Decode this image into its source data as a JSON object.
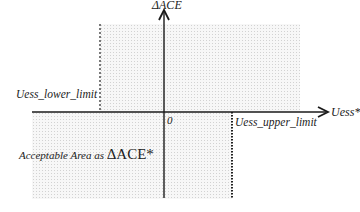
{
  "diagram": {
    "y_axis_label": "ΔACE",
    "x_axis_label": "Uess*",
    "origin_label": "0",
    "lower_limit_label": "Uess_lower_limit",
    "upper_limit_label": "Uess_upper_limit",
    "area_label_prefix": "Acceptable Area as ",
    "area_label_symbol": "ΔACE*",
    "colors": {
      "axis": "#1a1a1a",
      "shade": "#f2f2f2",
      "text": "#222222"
    }
  }
}
